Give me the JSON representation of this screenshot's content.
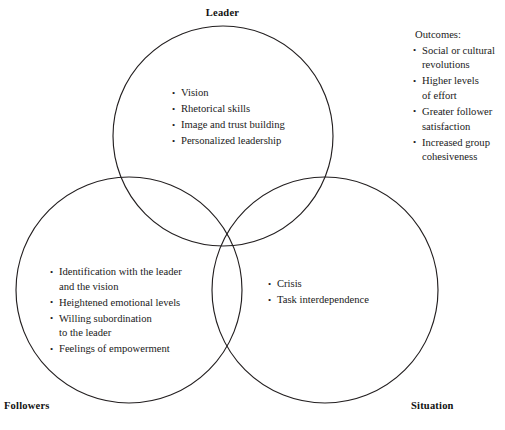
{
  "diagram": {
    "title_hidden": "",
    "background_color": "#ffffff",
    "stroke_color": "#231f20",
    "text_color": "#1a1a1a",
    "circles": [
      {
        "name": "Leader",
        "cx": 223,
        "cy": 136,
        "r": 110
      },
      {
        "name": "Followers",
        "cx": 129,
        "cy": 290,
        "r": 113
      },
      {
        "name": "Situation",
        "cx": 325,
        "cy": 290,
        "r": 113
      }
    ]
  },
  "labels": {
    "leader": "Leader",
    "followers": "Followers",
    "situation": "Situation"
  },
  "leader_items": [
    "Vision",
    "Rhetorical skills",
    "Image and trust building",
    "Personalized leadership"
  ],
  "followers_items": [
    "Identification with the leader\nand the vision",
    "Heightened emotional levels",
    "Willing subordination\nto the leader",
    "Feelings of empowerment"
  ],
  "situation_items": [
    "Crisis",
    "Task interdependence"
  ],
  "outcomes": {
    "heading": "Outcomes:",
    "items": [
      "Social or cultural\nrevolutions",
      "Higher levels\nof effort",
      "Greater follower\nsatisfaction",
      "Increased group\ncohesiveness"
    ]
  }
}
